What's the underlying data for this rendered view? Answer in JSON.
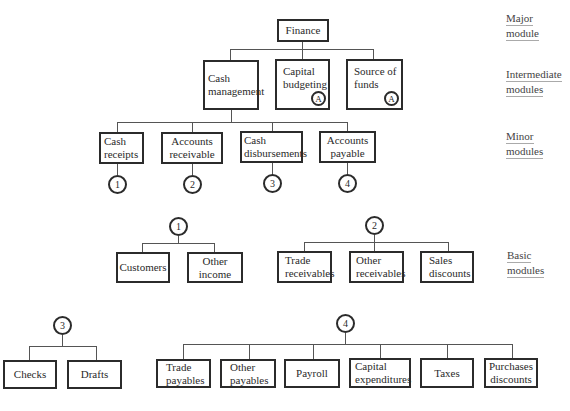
{
  "levels": {
    "major": {
      "line1": "Major",
      "line2": "module"
    },
    "intermediate": {
      "line1": "Intermediate",
      "line2": "modules"
    },
    "minor": {
      "line1": "Minor",
      "line2": "modules"
    },
    "basic": {
      "line1": "Basic",
      "line2": "modules"
    }
  },
  "root": {
    "label": "Finance"
  },
  "intermediate": [
    {
      "line1": "Cash",
      "line2": "management"
    },
    {
      "line1": "Capital",
      "line2": "budgeting",
      "connector": "A"
    },
    {
      "line1": "Source of",
      "line2": "funds",
      "connector": "A"
    }
  ],
  "minor": [
    {
      "line1": "Cash",
      "line2": "receipts",
      "connector": "1"
    },
    {
      "line1": "Accounts",
      "line2": "receivable",
      "connector": "2"
    },
    {
      "line1": "Cash",
      "line2": "disbursements",
      "connector": "3"
    },
    {
      "line1": "Accounts",
      "line2": "payable",
      "connector": "4"
    }
  ],
  "basic_groups": {
    "g1": {
      "connector": "1",
      "items": [
        {
          "line1": "Customers",
          "line2": ""
        },
        {
          "line1": "Other",
          "line2": "income"
        }
      ]
    },
    "g2": {
      "connector": "2",
      "items": [
        {
          "line1": "Trade",
          "line2": "receivables"
        },
        {
          "line1": "Other",
          "line2": "receivables"
        },
        {
          "line1": "Sales",
          "line2": "discounts"
        }
      ]
    },
    "g3": {
      "connector": "3",
      "items": [
        {
          "line1": "Checks",
          "line2": ""
        },
        {
          "line1": "Drafts",
          "line2": ""
        }
      ]
    },
    "g4": {
      "connector": "4",
      "items": [
        {
          "line1": "Trade",
          "line2": "payables"
        },
        {
          "line1": "Other",
          "line2": "payables"
        },
        {
          "line1": "Payroll",
          "line2": ""
        },
        {
          "line1": "Capital",
          "line2": "expenditures"
        },
        {
          "line1": "Taxes",
          "line2": ""
        },
        {
          "line1": "Purchases",
          "line2": "discounts"
        }
      ]
    }
  }
}
